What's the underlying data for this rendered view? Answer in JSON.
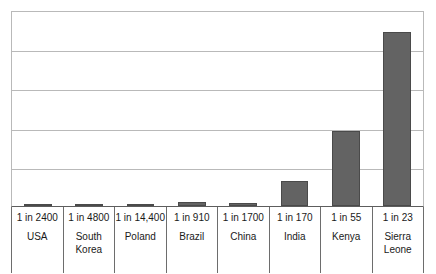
{
  "chart_data": {
    "type": "bar",
    "title": "",
    "subtitle": "",
    "xlabel": "",
    "ylabel": "",
    "grid": true,
    "gridline_count": 5,
    "legend": "none",
    "ylim": [
      0,
      0.0489
    ],
    "y_axis_visible_ticks": false,
    "value_meaning": "lifetime risk of maternal death expressed as 1 in N; bar height is proportional to 1/N",
    "categories": [
      "USA",
      "South Korea",
      "Poland",
      "Brazil",
      "China",
      "India",
      "Kenya",
      "Sierra Leone"
    ],
    "rate_labels": [
      "1 in 2400",
      "1 in 4800",
      "1 in 14,400",
      "1 in 910",
      "1 in 1700",
      "1 in 170",
      "1 in 55",
      "1 in 23"
    ],
    "denominators": [
      2400,
      4800,
      14400,
      910,
      1700,
      170,
      55,
      23
    ],
    "values": [
      0.000417,
      0.000208,
      6.94e-05,
      0.0010989,
      0.000588,
      0.005882,
      0.018182,
      0.043478
    ],
    "bar_pixel_heights": [
      2,
      2,
      1,
      4,
      3,
      25,
      75,
      174
    ]
  },
  "bars": [
    {
      "country": "USA",
      "rate": "1 in 2400",
      "height_px": 2
    },
    {
      "country": "South\nKorea",
      "rate": "1 in 4800",
      "height_px": 2
    },
    {
      "country": "Poland",
      "rate": "1 in 14,400",
      "height_px": 1
    },
    {
      "country": "Brazil",
      "rate": "1 in 910",
      "height_px": 4
    },
    {
      "country": "China",
      "rate": "1 in 1700",
      "height_px": 3
    },
    {
      "country": "India",
      "rate": "1 in 170",
      "height_px": 25
    },
    {
      "country": "Kenya",
      "rate": "1 in 55",
      "height_px": 75
    },
    {
      "country": "Sierra\nLeone",
      "rate": "1 in 23",
      "height_px": 174
    }
  ],
  "style": {
    "bar_fill": "#636363",
    "bar_border": "#4a4a4a",
    "gridline_color": "#b9b9b9",
    "axis_color": "#5d5d5d",
    "table_border": "#6d6d6d",
    "background": "#ffffff",
    "text_color": "#1a1a1a"
  }
}
